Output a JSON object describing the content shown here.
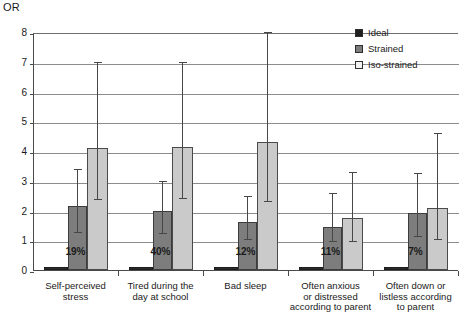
{
  "chart_data": {
    "type": "bar",
    "title": "",
    "ylabel": "OR",
    "xlabel": "",
    "ylim": [
      0,
      8
    ],
    "yticks": [
      0,
      1,
      2,
      3,
      4,
      5,
      6,
      7,
      8
    ],
    "ytick_labels": [
      "0",
      "1",
      "2",
      "3",
      "4",
      "5",
      "6",
      "7",
      "8"
    ],
    "grid": true,
    "legend_position": "top-right",
    "reference_line": 1,
    "categories": [
      "Self-perceived stress",
      "Tired during the day at school",
      "Bad sleep",
      "Often anxious or distressed according to parent",
      "Often down or listless according to parent"
    ],
    "category_lines": [
      [
        "Self-perceived",
        "stress"
      ],
      [
        "Tired during the",
        "day at school"
      ],
      [
        "Bad sleep"
      ],
      [
        "Often anxious",
        "or distressed",
        "according to parent"
      ],
      [
        "Often down or",
        "listless according",
        "to parent"
      ]
    ],
    "prevalence_labels": [
      "19%",
      "40%",
      "12%",
      "11%",
      "7%"
    ],
    "series": [
      {
        "name": "Ideal",
        "color": "#2b2b2b",
        "values": [
          1.0,
          1.0,
          1.0,
          1.0,
          1.0
        ],
        "ci_low": [
          null,
          null,
          null,
          null,
          null
        ],
        "ci_high": [
          null,
          null,
          null,
          null,
          null
        ]
      },
      {
        "name": "Strained",
        "color": "#7d7d7d",
        "values": [
          2.15,
          2.0,
          1.6,
          1.45,
          1.9
        ],
        "ci_low": [
          1.25,
          1.2,
          1.0,
          0.95,
          1.1
        ],
        "ci_high": [
          3.4,
          3.0,
          2.5,
          2.6,
          3.25
        ]
      },
      {
        "name": "Iso-strained",
        "color": "#cacaca",
        "values": [
          4.1,
          4.15,
          4.3,
          1.75,
          2.1
        ],
        "ci_low": [
          2.35,
          2.4,
          2.3,
          0.95,
          1.0
        ],
        "ci_high": [
          7.0,
          7.0,
          8.0,
          3.3,
          4.6
        ]
      }
    ]
  },
  "legend": {
    "items": [
      {
        "label": "Ideal",
        "swatch": "ideal"
      },
      {
        "label": "Strained",
        "swatch": "strained"
      },
      {
        "label": "Iso-strained",
        "swatch": "iso"
      }
    ]
  }
}
